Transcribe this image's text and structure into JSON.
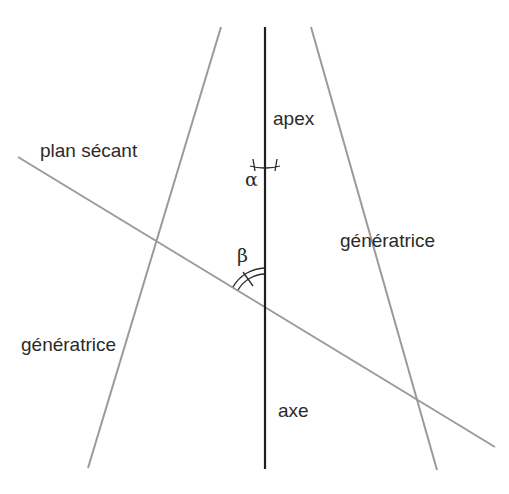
{
  "diagram": {
    "labels": {
      "apex": "apex",
      "plan_secant": "plan sécant",
      "generatrice_right": "génératrice",
      "generatrice_left": "génératrice",
      "axe": "axe",
      "alpha": "α",
      "beta": "β"
    },
    "colors": {
      "axis": "#1e1e1e",
      "lines": "#9a9a9a",
      "text": "#2a2a2a"
    }
  }
}
